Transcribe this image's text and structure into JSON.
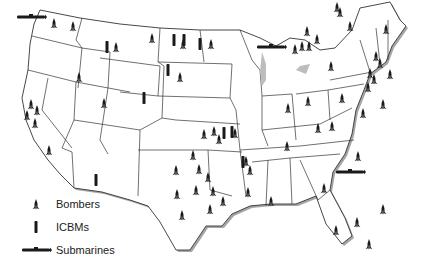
{
  "map": {
    "region": "Continental United States",
    "colors": {
      "land": "#ffffff",
      "border": "#333333",
      "shadow": "#9a9a9a",
      "symbol": "#1a1a1a"
    }
  },
  "legend": {
    "items": [
      {
        "symbol": "bomber-icon",
        "label": "Bombers"
      },
      {
        "symbol": "icbm-icon",
        "label": "ICBMs"
      },
      {
        "symbol": "submarine-icon",
        "label": "Submarines"
      }
    ]
  },
  "markers": {
    "bombers": [
      [
        54,
        23
      ],
      [
        73,
        26
      ],
      [
        116,
        47
      ],
      [
        79,
        77
      ],
      [
        152,
        38
      ],
      [
        183,
        44
      ],
      [
        211,
        44
      ],
      [
        180,
        77
      ],
      [
        31,
        104
      ],
      [
        37,
        110
      ],
      [
        27,
        115
      ],
      [
        35,
        123
      ],
      [
        49,
        150
      ],
      [
        104,
        103
      ],
      [
        204,
        134
      ],
      [
        214,
        131
      ],
      [
        219,
        139
      ],
      [
        235,
        133
      ],
      [
        193,
        155
      ],
      [
        199,
        169
      ],
      [
        176,
        170
      ],
      [
        208,
        177
      ],
      [
        196,
        190
      ],
      [
        213,
        191
      ],
      [
        223,
        201
      ],
      [
        210,
        209
      ],
      [
        246,
        161
      ],
      [
        250,
        170
      ],
      [
        248,
        192
      ],
      [
        182,
        215
      ],
      [
        177,
        194
      ],
      [
        271,
        201
      ],
      [
        288,
        108
      ],
      [
        287,
        146
      ],
      [
        308,
        101
      ],
      [
        332,
        126
      ],
      [
        318,
        128
      ],
      [
        342,
        98
      ],
      [
        350,
        26
      ],
      [
        337,
        7
      ],
      [
        386,
        29
      ],
      [
        376,
        56
      ],
      [
        380,
        63
      ],
      [
        370,
        73
      ],
      [
        390,
        74
      ],
      [
        374,
        79
      ],
      [
        363,
        113
      ],
      [
        383,
        104
      ],
      [
        368,
        87
      ],
      [
        307,
        31
      ],
      [
        340,
        12
      ],
      [
        295,
        49
      ],
      [
        302,
        46
      ],
      [
        317,
        39
      ],
      [
        309,
        46
      ],
      [
        331,
        66
      ],
      [
        369,
        244
      ],
      [
        324,
        188
      ],
      [
        358,
        156
      ],
      [
        357,
        222
      ],
      [
        336,
        230
      ],
      [
        383,
        209
      ]
    ],
    "icbms": [
      [
        107,
        47
      ],
      [
        174,
        40
      ],
      [
        184,
        40
      ],
      [
        200,
        44
      ],
      [
        168,
        70
      ],
      [
        144,
        98
      ],
      [
        224,
        133
      ],
      [
        232,
        132
      ],
      [
        243,
        162
      ],
      [
        96,
        180
      ]
    ],
    "submarines": [
      [
        31,
        17
      ],
      [
        350,
        172
      ],
      [
        271,
        47
      ]
    ]
  }
}
